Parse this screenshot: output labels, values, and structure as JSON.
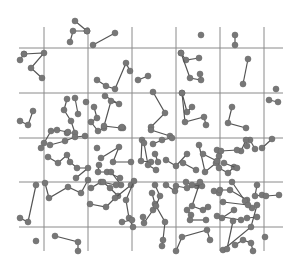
{
  "diagram": {
    "title": "",
    "width": 302,
    "height": 267,
    "colors": {
      "grid": "#8a8a8a",
      "line": "#555555",
      "point": "#777777",
      "background": "#ffffff"
    },
    "grid": {
      "vertical_x": [
        44,
        88,
        132,
        176,
        220,
        264
      ],
      "vertical_y_range": [
        27,
        251
      ],
      "horizontal_y": [
        48,
        93,
        138,
        182,
        227
      ],
      "horizontal_x_range": [
        19,
        283
      ]
    },
    "point_radius": 3,
    "walks": [
      [
        [
          75,
          21
        ],
        [
          87,
          31
        ],
        [
          87,
          31
        ]
      ],
      [
        [
          70,
          42
        ],
        [
          73,
          31
        ],
        [
          87,
          31
        ]
      ],
      [
        [
          93,
          45
        ],
        [
          115,
          33
        ]
      ],
      [
        [
          24,
          54
        ],
        [
          44,
          53
        ],
        [
          31,
          68
        ],
        [
          42,
          78
        ]
      ],
      [
        [
          24,
          54
        ],
        [
          20,
          60
        ]
      ],
      [
        [
          201,
          35
        ]
      ],
      [
        [
          235,
          35
        ],
        [
          235,
          45
        ]
      ],
      [
        [
          181,
          53
        ],
        [
          186,
          60
        ],
        [
          199,
          58
        ]
      ],
      [
        [
          181,
          53
        ],
        [
          190,
          78
        ],
        [
          201,
          80
        ],
        [
          200,
          74
        ]
      ],
      [
        [
          248,
          59
        ],
        [
          243,
          84
        ]
      ],
      [
        [
          97,
          80
        ],
        [
          106,
          86
        ],
        [
          115,
          89
        ],
        [
          126,
          63
        ],
        [
          130,
          71
        ]
      ],
      [
        [
          138,
          80
        ],
        [
          148,
          76
        ]
      ],
      [
        [
          276,
          89
        ]
      ],
      [
        [
          33,
          111
        ],
        [
          28,
          125
        ],
        [
          20,
          121
        ]
      ],
      [
        [
          67,
          99
        ],
        [
          64,
          110
        ],
        [
          71,
          121
        ],
        [
          75,
          133
        ],
        [
          67,
          133
        ]
      ],
      [
        [
          75,
          98
        ],
        [
          78,
          114
        ]
      ],
      [
        [
          44,
          143
        ],
        [
          51,
          131
        ],
        [
          57,
          130
        ],
        [
          68,
          132
        ]
      ],
      [
        [
          86,
          102
        ]
      ],
      [
        [
          94,
          107
        ],
        [
          97,
          118
        ],
        [
          91,
          122
        ],
        [
          98,
          131
        ],
        [
          104,
          128
        ]
      ],
      [
        [
          105,
          96
        ],
        [
          119,
          104
        ],
        [
          111,
          101
        ],
        [
          104,
          126
        ],
        [
          121,
          128
        ]
      ],
      [
        [
          123,
          128
        ],
        [
          122,
          127
        ]
      ],
      [
        [
          153,
          92
        ],
        [
          165,
          113
        ],
        [
          151,
          127
        ]
      ],
      [
        [
          151,
          130
        ],
        [
          170,
          136
        ]
      ],
      [
        [
          182,
          93
        ],
        [
          187,
          112
        ],
        [
          192,
          107
        ]
      ],
      [
        [
          182,
          93
        ],
        [
          185,
          122
        ],
        [
          204,
          117
        ],
        [
          206,
          125
        ]
      ],
      [
        [
          232,
          107
        ],
        [
          228,
          123
        ],
        [
          246,
          128
        ]
      ],
      [
        [
          269,
          100
        ],
        [
          278,
          102
        ]
      ],
      [
        [
          41,
          148
        ]
      ],
      [
        [
          50,
          145
        ],
        [
          65,
          141
        ],
        [
          75,
          137
        ],
        [
          85,
          136
        ]
      ],
      [
        [
          48,
          157
        ],
        [
          58,
          163
        ],
        [
          67,
          155
        ],
        [
          70,
          162
        ],
        [
          77,
          168
        ],
        [
          88,
          168
        ],
        [
          76,
          178
        ]
      ],
      [
        [
          97,
          148
        ]
      ],
      [
        [
          101,
          158
        ],
        [
          119,
          147
        ],
        [
          113,
          162
        ],
        [
          131,
          162
        ]
      ],
      [
        [
          99,
          165
        ],
        [
          98,
          172
        ],
        [
          107,
          172
        ],
        [
          120,
          178
        ]
      ],
      [
        [
          111,
          172
        ],
        [
          121,
          185
        ]
      ],
      [
        [
          142,
          140
        ],
        [
          141,
          161
        ],
        [
          151,
          162
        ]
      ],
      [
        [
          144,
          143
        ],
        [
          148,
          165
        ],
        [
          156,
          170
        ]
      ],
      [
        [
          155,
          154
        ],
        [
          158,
          162
        ]
      ],
      [
        [
          153,
          144
        ],
        [
          162,
          140
        ],
        [
          172,
          138
        ]
      ],
      [
        [
          166,
          160
        ],
        [
          176,
          166
        ],
        [
          187,
          154
        ]
      ],
      [
        [
          183,
          163
        ],
        [
          196,
          170
        ]
      ],
      [
        [
          199,
          145
        ],
        [
          205,
          172
        ],
        [
          216,
          163
        ]
      ],
      [
        [
          217,
          150
        ],
        [
          219,
          156
        ],
        [
          219,
          168
        ],
        [
          228,
          173
        ],
        [
          234,
          167
        ]
      ],
      [
        [
          224,
          163
        ],
        [
          237,
          168
        ]
      ],
      [
        [
          250,
          140
        ],
        [
          255,
          149
        ]
      ],
      [
        [
          241,
          151
        ],
        [
          246,
          140
        ],
        [
          247,
          146
        ]
      ],
      [
        [
          262,
          148
        ],
        [
          272,
          139
        ]
      ],
      [
        [
          203,
          154
        ],
        [
          217,
          161
        ]
      ],
      [
        [
          36,
          185
        ],
        [
          28,
          222
        ],
        [
          20,
          218
        ]
      ],
      [
        [
          45,
          183
        ],
        [
          49,
          198
        ],
        [
          68,
          187
        ],
        [
          81,
          193
        ],
        [
          88,
          180
        ]
      ],
      [
        [
          91,
          188
        ],
        [
          101,
          182
        ],
        [
          116,
          185
        ]
      ],
      [
        [
          103,
          182
        ],
        [
          110,
          188
        ],
        [
          118,
          196
        ]
      ],
      [
        [
          90,
          204
        ],
        [
          106,
          207
        ],
        [
          115,
          198
        ],
        [
          131,
          185
        ]
      ],
      [
        [
          134,
          181
        ],
        [
          126,
          200
        ],
        [
          129,
          218
        ],
        [
          133,
          227
        ]
      ],
      [
        [
          132,
          220
        ],
        [
          122,
          222
        ]
      ],
      [
        [
          152,
          193
        ],
        [
          155,
          204
        ],
        [
          153,
          210
        ],
        [
          144,
          223
        ],
        [
          143,
          217
        ]
      ],
      [
        [
          166,
          185
        ],
        [
          175,
          191
        ]
      ],
      [
        [
          155,
          185
        ],
        [
          160,
          196
        ],
        [
          156,
          206
        ],
        [
          165,
          222
        ],
        [
          163,
          240
        ],
        [
          162,
          246
        ]
      ],
      [
        [
          176,
          186
        ],
        [
          187,
          188
        ],
        [
          197,
          186
        ]
      ],
      [
        [
          191,
          215
        ],
        [
          187,
          210
        ]
      ],
      [
        [
          186,
          182
        ],
        [
          192,
          185
        ],
        [
          202,
          186
        ]
      ],
      [
        [
          200,
          182
        ],
        [
          192,
          206
        ],
        [
          203,
          210
        ],
        [
          208,
          207
        ]
      ],
      [
        [
          206,
          220
        ],
        [
          190,
          220
        ]
      ],
      [
        [
          214,
          191
        ],
        [
          219,
          193
        ]
      ],
      [
        [
          220,
          190
        ],
        [
          230,
          190
        ],
        [
          247,
          200
        ],
        [
          252,
          208
        ]
      ],
      [
        [
          257,
          185
        ],
        [
          255,
          196
        ],
        [
          262,
          195
        ]
      ],
      [
        [
          257,
          205
        ],
        [
          251,
          227
        ],
        [
          223,
          250
        ]
      ],
      [
        [
          247,
          218
        ],
        [
          257,
          217
        ]
      ],
      [
        [
          217,
          216
        ],
        [
          241,
          220
        ]
      ],
      [
        [
          266,
          196
        ],
        [
          279,
          195
        ]
      ],
      [
        [
          232,
          182
        ],
        [
          245,
          201
        ]
      ],
      [
        [
          223,
          202
        ],
        [
          248,
          205
        ]
      ],
      [
        [
          222,
          218
        ],
        [
          234,
          210
        ]
      ],
      [
        [
          233,
          221
        ],
        [
          227,
          249
        ]
      ],
      [
        [
          36,
          241
        ]
      ],
      [
        [
          55,
          236
        ],
        [
          78,
          242
        ],
        [
          78,
          251
        ]
      ],
      [
        [
          176,
          251
        ],
        [
          182,
          237
        ],
        [
          207,
          230
        ],
        [
          210,
          240
        ]
      ],
      [
        [
          235,
          245
        ],
        [
          243,
          240
        ],
        [
          251,
          243
        ],
        [
          253,
          251
        ]
      ],
      [
        [
          265,
          237
        ]
      ],
      [
        [
          221,
          151
        ],
        [
          237,
          150
        ]
      ]
    ]
  }
}
